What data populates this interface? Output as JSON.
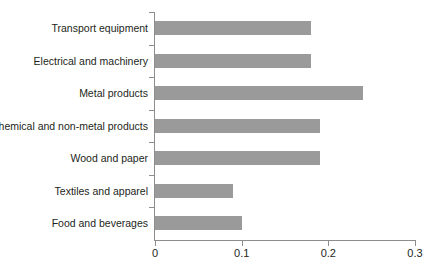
{
  "chart_data": {
    "type": "bar",
    "orientation": "horizontal",
    "title": "",
    "subtitle": "",
    "xlabel": "",
    "ylabel": "",
    "categories": [
      "Transport equipment",
      "Electrical and machinery",
      "Metal products",
      "Chemical and non-metal products",
      "Wood and paper",
      "Textiles and apparel",
      "Food and beverages"
    ],
    "values": [
      0.18,
      0.18,
      0.24,
      0.19,
      0.19,
      0.09,
      0.1
    ],
    "series": [
      {
        "name": "value",
        "values": [
          0.18,
          0.18,
          0.24,
          0.19,
          0.19,
          0.09,
          0.1
        ]
      }
    ],
    "xlim": [
      0,
      0.3
    ],
    "xticks": [
      0,
      0.1,
      0.2,
      0.3
    ],
    "xtick_labels": [
      "0",
      "0.1",
      "0.2",
      "0.3"
    ],
    "grid": false,
    "legend": false,
    "bar_color": "#9a9a9a",
    "axis_color": "#8d8d8d",
    "text_color": "#231f20"
  }
}
